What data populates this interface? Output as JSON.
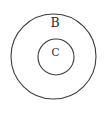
{
  "figure": {
    "type": "euler-diagram",
    "width": 107,
    "height": 115,
    "background_color": "#ffffff",
    "stroke_color": "#3c3c3c",
    "label_color": "#2e2e2e"
  },
  "sets": [
    {
      "id": "outer",
      "label": "B",
      "shape": "circle",
      "cx": 53.5,
      "cy": 56.5,
      "r": 42.5,
      "stroke_width": 1.1,
      "label_x": 55,
      "label_y": 23,
      "label_font_size": 12.5
    },
    {
      "id": "inner",
      "label": "C",
      "shape": "circle",
      "cx": 56,
      "cy": 57,
      "r": 18,
      "stroke_width": 1.1,
      "label_x": 55.5,
      "label_y": 53,
      "label_font_size": 10.5
    }
  ]
}
